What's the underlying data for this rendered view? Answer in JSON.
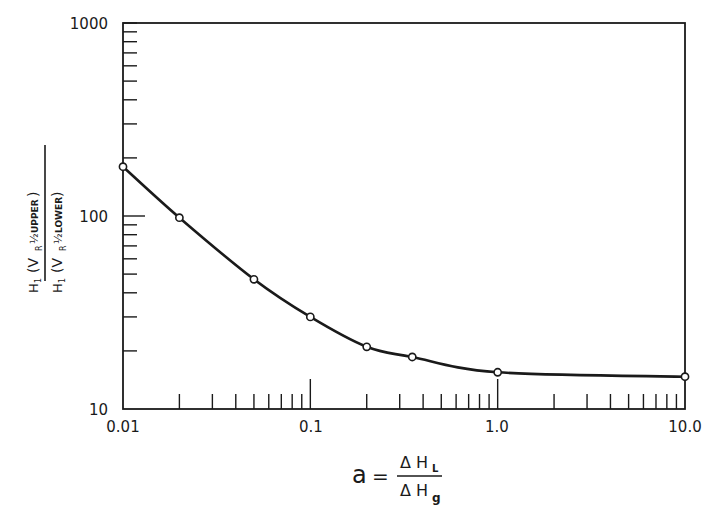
{
  "chart_data": {
    "type": "line",
    "title": "",
    "xscale": "log",
    "yscale": "log",
    "xlabel": {
      "lhs": "a",
      "equals": "=",
      "numerator": "Δ H",
      "numerator_sub": "L",
      "denominator": "Δ H",
      "denominator_sub": "g"
    },
    "ylabel": {
      "numerator": "H",
      "numerator_sub": "1",
      "numerator_paren": "(V",
      "numerator_paren_sub": "R",
      "numerator_half": "½",
      "numerator_tag": "UPPER",
      "denominator": "H",
      "denominator_sub": "1",
      "denominator_paren": "(V",
      "denominator_paren_sub": "R",
      "denominator_half": "½",
      "denominator_tag": "LOWER"
    },
    "xlim": [
      0.01,
      10.0
    ],
    "ylim": [
      10,
      1000
    ],
    "x_tick_labels": [
      "0.01",
      "0.1",
      "1.0",
      "10.0"
    ],
    "y_tick_labels": [
      "10",
      "100",
      "1000"
    ],
    "grid": false,
    "legend": null,
    "series": [
      {
        "name": "ratio",
        "marker": "open-circle",
        "x": [
          0.01,
          0.02,
          0.05,
          0.1,
          0.2,
          0.35,
          1.0,
          10.0
        ],
        "y": [
          180,
          98,
          47,
          30,
          21,
          18.6,
          15.5,
          14.7
        ]
      }
    ]
  }
}
